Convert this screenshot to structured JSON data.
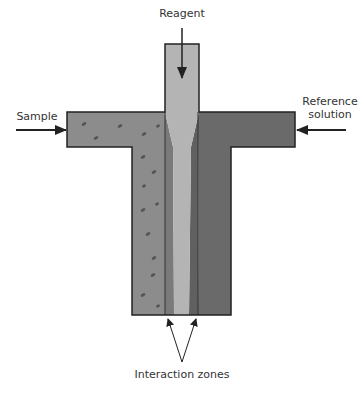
{
  "diagram": {
    "labels": {
      "reagent": "Reagent",
      "sample": "Sample",
      "reference_line1": "Reference",
      "reference_line2": "solution",
      "interaction_zones": "Interaction zones"
    },
    "colors": {
      "sample_stream": "#8c8c8c",
      "reagent_stream": "#b4b4b4",
      "reference_stream": "#6a6a6a",
      "interaction_zone": "#7a7a7a",
      "outline": "#222222",
      "particles": "#555555"
    }
  }
}
